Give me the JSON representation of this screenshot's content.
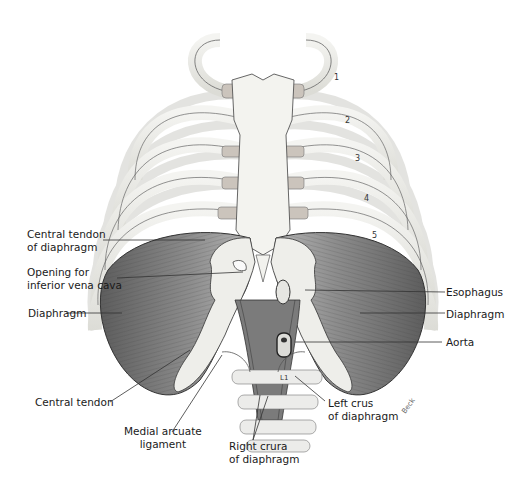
{
  "figure": {
    "labels_left": [
      {
        "id": "central-tendon-of-diaphragm",
        "lines": [
          "Central tendon",
          "of diaphragm"
        ]
      },
      {
        "id": "opening-ivc",
        "lines": [
          "Opening for",
          "inferior vena cava"
        ]
      },
      {
        "id": "diaphragm-left-side",
        "lines": [
          "Diaphragm"
        ]
      },
      {
        "id": "central-tendon",
        "lines": [
          "Central tendon"
        ]
      }
    ],
    "labels_right": [
      {
        "id": "esophagus",
        "lines": [
          "Esophagus"
        ]
      },
      {
        "id": "diaphragm-right-side",
        "lines": [
          "Diaphragm"
        ]
      },
      {
        "id": "aorta",
        "lines": [
          "Aorta"
        ]
      }
    ],
    "labels_bottom": [
      {
        "id": "medial-arcuate-ligament",
        "lines": [
          "Medial arcuate",
          "ligament"
        ]
      },
      {
        "id": "right-crura",
        "lines": [
          "Right crura",
          "of diaphragm"
        ]
      },
      {
        "id": "left-crus",
        "lines": [
          "Left crus",
          "of diaphragm"
        ]
      }
    ],
    "rib_numbers": [
      "1",
      "2",
      "3",
      "4",
      "5"
    ],
    "vertebra_label": "L1",
    "signature": "Beck",
    "colors": {
      "bone": "#eeeeea",
      "bone_outline": "#555555",
      "cartilage": "#c9c2ba",
      "muscle": "#9a9a9a",
      "muscle_dark": "#5c5c5c",
      "label_text": "#1a1a1a",
      "leader_line": "#333333"
    }
  }
}
